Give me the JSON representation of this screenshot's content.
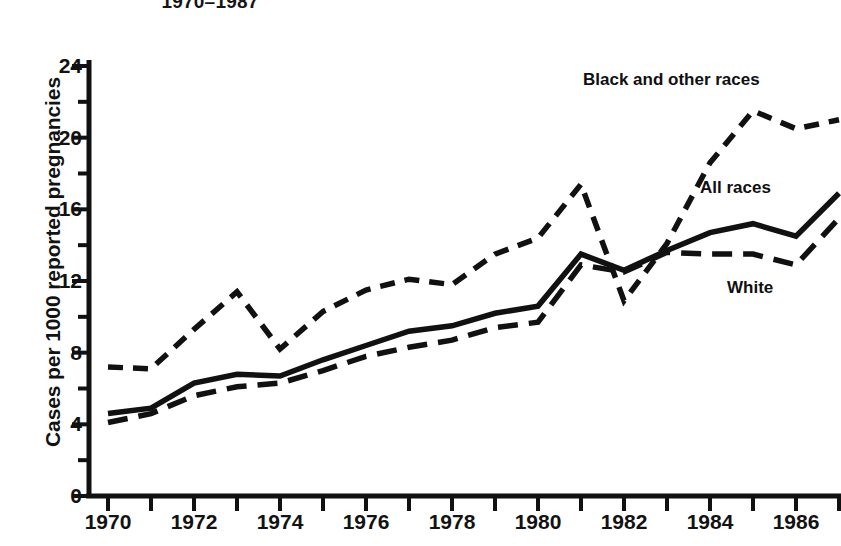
{
  "chart_data": {
    "type": "line",
    "title": "1970–1987",
    "xlabel": "",
    "ylabel": "Cases per 1000 reported pregnancies",
    "xlim": [
      1970,
      1987
    ],
    "ylim": [
      0,
      24
    ],
    "ytick_values": [
      0,
      4,
      8,
      12,
      16,
      20,
      24
    ],
    "ytick_labels": [
      "0",
      "4",
      "8",
      "12",
      "16",
      "20",
      "24"
    ],
    "yminor_values": [
      2,
      6,
      10,
      14,
      18,
      22
    ],
    "xtick_values": [
      1970,
      1971,
      1972,
      1973,
      1974,
      1975,
      1976,
      1977,
      1978,
      1979,
      1980,
      1981,
      1982,
      1983,
      1984,
      1985,
      1986,
      1987
    ],
    "xtick_labels": [
      "1970",
      "",
      "1972",
      "",
      "1974",
      "",
      "1976",
      "",
      "1978",
      "",
      "1980",
      "",
      "1982",
      "",
      "1984",
      "",
      "1986",
      ""
    ],
    "grid": false,
    "legend_position": "inline-annotations",
    "x": [
      1970,
      1971,
      1972,
      1973,
      1974,
      1975,
      1976,
      1977,
      1978,
      1979,
      1980,
      1981,
      1982,
      1983,
      1984,
      1985,
      1986,
      1987
    ],
    "series": [
      {
        "name": "Black and other races",
        "style": "dashed",
        "values": [
          7.2,
          7.1,
          9.3,
          11.4,
          8.2,
          10.3,
          11.5,
          12.1,
          11.8,
          13.5,
          14.4,
          17.4,
          10.9,
          14.1,
          18.6,
          21.5,
          20.5,
          21.0
        ]
      },
      {
        "name": "All races",
        "style": "solid",
        "values": [
          4.6,
          4.9,
          6.3,
          6.8,
          6.7,
          7.6,
          8.4,
          9.2,
          9.5,
          10.2,
          10.6,
          13.5,
          12.6,
          13.7,
          14.7,
          15.2,
          14.5,
          16.9
        ]
      },
      {
        "name": "White",
        "style": "dashed",
        "values": [
          4.1,
          4.6,
          5.6,
          6.1,
          6.3,
          7.0,
          7.8,
          8.3,
          8.7,
          9.4,
          9.7,
          12.9,
          12.5,
          13.6,
          13.5,
          13.5,
          12.9,
          15.5
        ]
      }
    ],
    "annotations": [
      {
        "name": "black-and-other-races-label",
        "text": "Black and other races"
      },
      {
        "name": "all-races-label",
        "text": "All races"
      },
      {
        "name": "white-label",
        "text": "White"
      }
    ]
  }
}
